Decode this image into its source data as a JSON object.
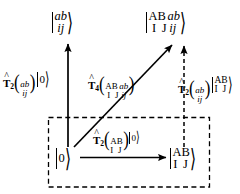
{
  "figure": {
    "kind": "quantum-chemistry-excitation-diagram",
    "background_color": "#ffffff",
    "stroke_color": "#000000",
    "width": 240,
    "height": 194
  },
  "states": {
    "top_left_ket": {
      "numerator": "ab",
      "denominator": "ij",
      "text": "|ab/ij>"
    },
    "top_right_ket": {
      "numerator_core": "AB",
      "numerator_virtual": "ab",
      "denominator_core": "I J",
      "denominator_occupied": "ij",
      "text": "|AB ab / I J ij>"
    },
    "bottom_left_ket": {
      "label": "0",
      "text": "|0>"
    },
    "bottom_right_ket": {
      "numerator": "AB",
      "denominator": "I J",
      "text": "|AB / I J>"
    }
  },
  "operators": {
    "left_vertical": {
      "symbol": "T",
      "subscript": "2",
      "arg_numerator": "ab",
      "arg_denominator": "ij",
      "applied_to": "0",
      "text": "T2(ab/ij)|0>"
    },
    "diagonal": {
      "symbol": "T",
      "subscript": "4",
      "arg_numerator_core": "AB",
      "arg_numerator_virtual": "ab",
      "arg_denominator_core": "I J",
      "arg_denominator_occupied": "ij",
      "text": "T4(AB ab / I J ij)"
    },
    "right_vertical": {
      "symbol": "T",
      "subscript": "2",
      "arg_numerator": "ab",
      "arg_denominator": "ij",
      "applied_numerator": "AB",
      "applied_denominator": "I J",
      "text": "T2(ab/ij)|AB / I J>"
    },
    "bottom_horizontal": {
      "symbol": "T",
      "subscript": "2",
      "arg_numerator": "AB",
      "arg_denominator": "I J",
      "applied_to": "0",
      "text": "T2(AB/I J)|0>"
    }
  },
  "arrows": {
    "left_vertical": {
      "style": "solid",
      "direction": "up"
    },
    "diagonal": {
      "style": "solid",
      "direction": "up-right"
    },
    "right_vertical": {
      "style": "dashed",
      "direction": "up"
    },
    "bottom_horizontal": {
      "style": "solid",
      "direction": "right"
    }
  },
  "dashed_box": {
    "style": "dashed",
    "encloses": [
      "|0>",
      "|AB / I J>",
      "T2(AB/I J)|0>"
    ]
  }
}
